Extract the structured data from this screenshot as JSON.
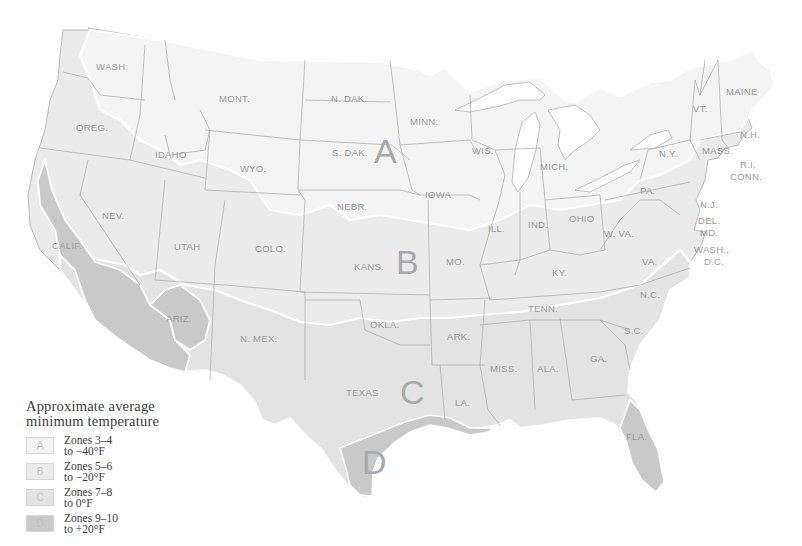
{
  "map": {
    "title": "Approximate average minimum temperature",
    "colors": {
      "zone_a": "#f4f4f4",
      "zone_b": "#ebebeb",
      "zone_c": "#e3e3e3",
      "zone_d": "#c9c9c9",
      "border": "#a8a8a8",
      "zone_outline": "#ffffff",
      "label": "#9a9a9a"
    },
    "zone_letters": [
      {
        "id": "A",
        "label": "A"
      },
      {
        "id": "B",
        "label": "B"
      },
      {
        "id": "C",
        "label": "C"
      },
      {
        "id": "D",
        "label": "D"
      }
    ],
    "states": [
      {
        "abbr": "WASH."
      },
      {
        "abbr": "OREG."
      },
      {
        "abbr": "CALIF."
      },
      {
        "abbr": "IDAHO"
      },
      {
        "abbr": "NEV."
      },
      {
        "abbr": "MONT."
      },
      {
        "abbr": "WYO."
      },
      {
        "abbr": "UTAH"
      },
      {
        "abbr": "ARIZ."
      },
      {
        "abbr": "COLO."
      },
      {
        "abbr": "N. MEX."
      },
      {
        "abbr": "N. DAK."
      },
      {
        "abbr": "S. DAK."
      },
      {
        "abbr": "NEBR."
      },
      {
        "abbr": "KANS."
      },
      {
        "abbr": "OKLA."
      },
      {
        "abbr": "TEXAS"
      },
      {
        "abbr": "MINN."
      },
      {
        "abbr": "IOWA"
      },
      {
        "abbr": "MO."
      },
      {
        "abbr": "ARK."
      },
      {
        "abbr": "LA."
      },
      {
        "abbr": "WIS."
      },
      {
        "abbr": "ILL."
      },
      {
        "abbr": "MICH."
      },
      {
        "abbr": "IND."
      },
      {
        "abbr": "OHIO"
      },
      {
        "abbr": "KY."
      },
      {
        "abbr": "TENN."
      },
      {
        "abbr": "MISS."
      },
      {
        "abbr": "ALA."
      },
      {
        "abbr": "GA."
      },
      {
        "abbr": "FLA."
      },
      {
        "abbr": "S.C."
      },
      {
        "abbr": "N.C."
      },
      {
        "abbr": "VA."
      },
      {
        "abbr": "W. VA."
      },
      {
        "abbr": "PA."
      },
      {
        "abbr": "N.Y."
      },
      {
        "abbr": "VT."
      },
      {
        "abbr": "N.H."
      },
      {
        "abbr": "MAINE"
      },
      {
        "abbr": "MASS."
      },
      {
        "abbr": "R.I."
      },
      {
        "abbr": "CONN."
      },
      {
        "abbr": "N.J."
      },
      {
        "abbr": "DEL."
      },
      {
        "abbr": "MD."
      },
      {
        "abbr": "WASH.,"
      },
      {
        "abbr": "D.C."
      }
    ]
  },
  "legend": {
    "title_line1": "Approximate average",
    "title_line2": "minimum temperature",
    "items": [
      {
        "swatch": "A",
        "line1": "Zones 3–4",
        "line2": "to  −40°F",
        "color": "#f4f4f4"
      },
      {
        "swatch": "B",
        "line1": "Zones 5–6",
        "line2": "to  −20°F",
        "color": "#ebebeb"
      },
      {
        "swatch": "C",
        "line1": "Zones 7–8",
        "line2": "to 0°F",
        "color": "#e3e3e3"
      },
      {
        "swatch": "D",
        "line1": "Zones 9–10",
        "line2": "to  +20°F",
        "color": "#c9c9c9"
      }
    ]
  }
}
